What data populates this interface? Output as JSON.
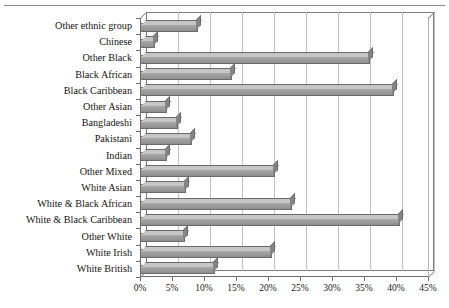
{
  "chart_data": {
    "type": "bar",
    "orientation": "horizontal",
    "title": "",
    "xlabel": "",
    "ylabel": "",
    "xlim": [
      0,
      45
    ],
    "xticks": [
      "0%",
      "5%",
      "10%",
      "15%",
      "20%",
      "25%",
      "30%",
      "35%",
      "40%",
      "45%"
    ],
    "xtick_values": [
      0,
      5,
      10,
      15,
      20,
      25,
      30,
      35,
      40,
      45
    ],
    "grid": true,
    "legend": "none",
    "style": "3d-bar",
    "bar_color": "#9a9a9a",
    "categories": [
      "Other ethnic group",
      "Chinese",
      "Other Black",
      "Black African",
      "Black Caribbean",
      "Other Asian",
      "Bangladeshi",
      "Pakistani",
      "Indian",
      "Other Mixed",
      "White Asian",
      "White & Black African",
      "White & Black Caribbean",
      "Other White",
      "White Irish",
      "White British"
    ],
    "values": [
      9.0,
      2.3,
      36.0,
      14.4,
      39.7,
      4.2,
      6.0,
      8.1,
      4.2,
      21.1,
      7.2,
      23.8,
      40.6,
      7.0,
      20.6,
      11.7
    ]
  }
}
